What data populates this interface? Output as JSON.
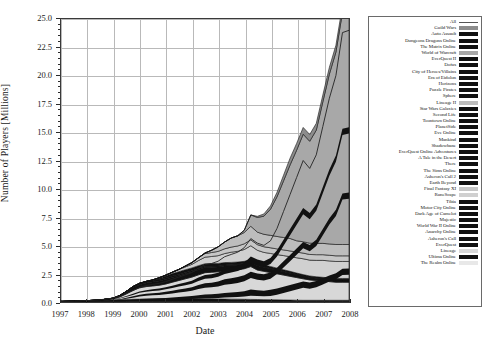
{
  "figure": {
    "xlabel": "Date",
    "ylabel": "Number of Players [Millions]"
  },
  "axes": {
    "yticks": [
      "0.0",
      "2.5",
      "5.0",
      "7.5",
      "10.0",
      "12.5",
      "15.0",
      "17.5",
      "20.0",
      "22.5",
      "25.0"
    ],
    "xticks": [
      "1997",
      "1998",
      "1999",
      "2000",
      "2001",
      "2002",
      "2003",
      "2004",
      "2005",
      "2006",
      "2007",
      "2008"
    ]
  },
  "legend": {
    "items": [
      {
        "label": "All",
        "swatch": "line",
        "color": "#555555"
      },
      {
        "label": "Guild Wars",
        "swatch": "fill",
        "color": "#8c8c8c"
      },
      {
        "label": "Auto Assault",
        "swatch": "fill",
        "color": "#111111"
      },
      {
        "label": "Dungeons Dragons Online",
        "swatch": "fill",
        "color": "#111111"
      },
      {
        "label": "The Matrix Online",
        "swatch": "fill",
        "color": "#111111"
      },
      {
        "label": "World of Warcraft",
        "swatch": "fill",
        "color": "#a8a8a8"
      },
      {
        "label": "EverQuest II",
        "swatch": "fill",
        "color": "#111111"
      },
      {
        "label": "Dofus",
        "swatch": "fill",
        "color": "#111111"
      },
      {
        "label": "City of Heroes/Villains",
        "swatch": "fill",
        "color": "#111111"
      },
      {
        "label": "Era of Eidolon",
        "swatch": "fill",
        "color": "#111111"
      },
      {
        "label": "Horizons",
        "swatch": "fill",
        "color": "#111111"
      },
      {
        "label": "Puzzle Pirates",
        "swatch": "fill",
        "color": "#111111"
      },
      {
        "label": "Sphere",
        "swatch": "fill",
        "color": "#111111"
      },
      {
        "label": "Lineage II",
        "swatch": "fill",
        "color": "#bdbdbd"
      },
      {
        "label": "Star Wars Galaxies",
        "swatch": "fill",
        "color": "#111111"
      },
      {
        "label": "Second Life",
        "swatch": "fill",
        "color": "#111111"
      },
      {
        "label": "Toontown Online",
        "swatch": "fill",
        "color": "#111111"
      },
      {
        "label": "PlanetSide",
        "swatch": "fill",
        "color": "#111111"
      },
      {
        "label": "Eve Online",
        "swatch": "fill",
        "color": "#111111"
      },
      {
        "label": "Mankind",
        "swatch": "fill",
        "color": "#111111"
      },
      {
        "label": "Shadowbane",
        "swatch": "fill",
        "color": "#111111"
      },
      {
        "label": "EverQuest Online Adventures",
        "swatch": "fill",
        "color": "#111111"
      },
      {
        "label": "A Tale in the Desert",
        "swatch": "fill",
        "color": "#111111"
      },
      {
        "label": "There",
        "swatch": "fill",
        "color": "#111111"
      },
      {
        "label": "The Sims Online",
        "swatch": "fill",
        "color": "#111111"
      },
      {
        "label": "Asheron's Call 2",
        "swatch": "fill",
        "color": "#111111"
      },
      {
        "label": "Earth Beyond",
        "swatch": "fill",
        "color": "#111111"
      },
      {
        "label": "Final Fantasy XI",
        "swatch": "fill",
        "color": "#c6c6c6"
      },
      {
        "label": "RuneScape",
        "swatch": "fill",
        "color": "#d0d0d0"
      },
      {
        "label": "Tibia",
        "swatch": "fill",
        "color": "#111111"
      },
      {
        "label": "Motor City Online",
        "swatch": "fill",
        "color": "#111111"
      },
      {
        "label": "Dark Age of Camelot",
        "swatch": "fill",
        "color": "#111111"
      },
      {
        "label": "Majestic",
        "swatch": "fill",
        "color": "#111111"
      },
      {
        "label": "World War II Online",
        "swatch": "fill",
        "color": "#111111"
      },
      {
        "label": "Anarchy Online",
        "swatch": "fill",
        "color": "#111111"
      },
      {
        "label": "Asheron's Call",
        "swatch": "fill",
        "color": "#111111"
      },
      {
        "label": "EverQuest",
        "swatch": "fill",
        "color": "#111111"
      },
      {
        "label": "Lineage",
        "swatch": "fill",
        "color": "#d8d8d8"
      },
      {
        "label": "Ultima Online",
        "swatch": "fill",
        "color": "#111111"
      },
      {
        "label": "The Realm Online",
        "swatch": "fill",
        "color": "#e8e8e8"
      }
    ]
  },
  "chart_data": {
    "type": "area",
    "title": "",
    "xlabel": "Date",
    "ylabel": "Number of Players [Millions]",
    "xlim": [
      1997,
      2008
    ],
    "ylim": [
      0,
      25
    ],
    "ytick_step": 2.5,
    "grid": true,
    "legend_position": "right-outside",
    "stacked": true,
    "x": [
      1997,
      1997.5,
      1998,
      1998.5,
      1999,
      1999.25,
      1999.5,
      1999.75,
      2000,
      2000.25,
      2000.5,
      2000.75,
      2001,
      2001.25,
      2001.5,
      2001.75,
      2002,
      2002.25,
      2002.5,
      2002.75,
      2003,
      2003.25,
      2003.5,
      2003.75,
      2004,
      2004.25,
      2004.5,
      2004.75,
      2005,
      2005.25,
      2005.5,
      2005.75,
      2006,
      2006.25,
      2006.5,
      2006.75,
      2007,
      2007.25,
      2007.5,
      2007.75,
      2008
    ],
    "total": [
      0.05,
      0.08,
      0.12,
      0.2,
      0.35,
      0.5,
      0.75,
      1.0,
      1.3,
      1.45,
      1.55,
      1.65,
      1.8,
      2.0,
      2.2,
      2.4,
      2.6,
      3.0,
      3.3,
      3.4,
      3.6,
      4.0,
      4.2,
      4.4,
      4.8,
      5.6,
      5.2,
      5.0,
      5.4,
      6.5,
      8.0,
      9.5,
      11.0,
      12.5,
      11.8,
      13.0,
      15.5,
      18.0,
      20.0,
      23.8,
      24.0
    ],
    "series": [
      {
        "name": "The Realm Online",
        "color": "#e8e8e8",
        "values": [
          0.03,
          0.04,
          0.05,
          0.05,
          0.05,
          0.05,
          0.05,
          0.05,
          0.05,
          0.05,
          0.05,
          0.05,
          0.05,
          0.05,
          0.05,
          0.05,
          0.05,
          0.05,
          0.05,
          0.05,
          0.05,
          0.05,
          0.05,
          0.05,
          0.05,
          0.05,
          0.05,
          0.05,
          0.05,
          0.05,
          0.05,
          0.05,
          0.05,
          0.05,
          0.05,
          0.05,
          0.05,
          0.05,
          0.05,
          0.05,
          0.05
        ]
      },
      {
        "name": "Ultima Online",
        "color": "#111111",
        "values": [
          0.02,
          0.04,
          0.07,
          0.1,
          0.13,
          0.15,
          0.17,
          0.19,
          0.2,
          0.21,
          0.22,
          0.23,
          0.24,
          0.25,
          0.25,
          0.25,
          0.25,
          0.25,
          0.24,
          0.23,
          0.22,
          0.21,
          0.2,
          0.2,
          0.19,
          0.18,
          0.17,
          0.16,
          0.15,
          0.14,
          0.13,
          0.12,
          0.11,
          0.1,
          0.1,
          0.1,
          0.1,
          0.1,
          0.1,
          0.1,
          0.1
        ]
      },
      {
        "name": "Lineage",
        "color": "#d8d8d8",
        "values": [
          0,
          0,
          0,
          0.02,
          0.1,
          0.25,
          0.5,
          0.8,
          1.0,
          1.1,
          1.15,
          1.2,
          1.3,
          1.45,
          1.6,
          1.75,
          1.9,
          2.1,
          2.3,
          2.35,
          2.4,
          2.5,
          2.55,
          2.6,
          2.7,
          2.9,
          2.6,
          2.5,
          2.4,
          2.3,
          2.2,
          2.1,
          2.0,
          1.9,
          1.8,
          1.75,
          1.7,
          1.65,
          1.6,
          1.6,
          1.6
        ]
      },
      {
        "name": "EverQuest",
        "color": "#111111",
        "values": [
          0,
          0,
          0,
          0.01,
          0.05,
          0.1,
          0.17,
          0.23,
          0.28,
          0.32,
          0.35,
          0.38,
          0.4,
          0.42,
          0.43,
          0.44,
          0.45,
          0.45,
          0.45,
          0.44,
          0.43,
          0.42,
          0.42,
          0.41,
          0.4,
          0.4,
          0.38,
          0.36,
          0.34,
          0.32,
          0.3,
          0.28,
          0.26,
          0.24,
          0.22,
          0.2,
          0.2,
          0.2,
          0.2,
          0.2,
          0.2
        ]
      },
      {
        "name": "Asheron's Call",
        "color": "#111111",
        "values": [
          0,
          0,
          0,
          0,
          0.01,
          0.03,
          0.06,
          0.09,
          0.11,
          0.12,
          0.12,
          0.12,
          0.12,
          0.12,
          0.11,
          0.11,
          0.1,
          0.1,
          0.09,
          0.09,
          0.08,
          0.08,
          0.07,
          0.07,
          0.06,
          0.06,
          0.05,
          0.05,
          0.05,
          0.04,
          0.04,
          0.04,
          0.03,
          0.03,
          0.03,
          0.03,
          0.03,
          0.03,
          0.03,
          0.03,
          0.03
        ]
      },
      {
        "name": "Dark Age of Camelot",
        "color": "#111111",
        "values": [
          0,
          0,
          0,
          0,
          0,
          0,
          0,
          0,
          0,
          0,
          0.02,
          0.1,
          0.18,
          0.22,
          0.24,
          0.25,
          0.26,
          0.26,
          0.25,
          0.24,
          0.23,
          0.22,
          0.21,
          0.2,
          0.19,
          0.18,
          0.17,
          0.16,
          0.15,
          0.14,
          0.13,
          0.12,
          0.11,
          0.1,
          0.1,
          0.1,
          0.1,
          0.1,
          0.1,
          0.1,
          0.1
        ]
      },
      {
        "name": "RuneScape",
        "color": "#d0d0d0",
        "values": [
          0,
          0,
          0,
          0,
          0,
          0,
          0,
          0,
          0.01,
          0.02,
          0.04,
          0.06,
          0.08,
          0.12,
          0.18,
          0.25,
          0.32,
          0.45,
          0.58,
          0.62,
          0.68,
          0.8,
          0.9,
          0.95,
          1.05,
          1.2,
          1.15,
          1.1,
          1.15,
          1.2,
          1.25,
          1.3,
          1.35,
          1.4,
          1.4,
          1.45,
          1.5,
          1.5,
          1.5,
          1.5,
          1.5
        ]
      },
      {
        "name": "Final Fantasy XI",
        "color": "#c6c6c6",
        "values": [
          0,
          0,
          0,
          0,
          0,
          0,
          0,
          0,
          0,
          0,
          0,
          0,
          0,
          0,
          0.02,
          0.08,
          0.15,
          0.25,
          0.32,
          0.35,
          0.38,
          0.42,
          0.45,
          0.47,
          0.5,
          0.52,
          0.5,
          0.5,
          0.5,
          0.5,
          0.5,
          0.5,
          0.5,
          0.5,
          0.5,
          0.5,
          0.5,
          0.5,
          0.5,
          0.5,
          0.5
        ]
      },
      {
        "name": "Lineage II",
        "color": "#bdbdbd",
        "values": [
          0,
          0,
          0,
          0,
          0,
          0,
          0,
          0,
          0,
          0,
          0,
          0,
          0,
          0,
          0,
          0,
          0,
          0,
          0.05,
          0.2,
          0.4,
          0.6,
          0.8,
          0.9,
          1.0,
          1.2,
          1.1,
          1.1,
          1.1,
          1.1,
          1.1,
          1.1,
          1.0,
          1.0,
          1.0,
          1.0,
          1.0,
          1.0,
          1.0,
          1.0,
          1.0
        ]
      },
      {
        "name": "World of Warcraft",
        "color": "#a8a8a8",
        "values": [
          0,
          0,
          0,
          0,
          0,
          0,
          0,
          0,
          0,
          0,
          0,
          0,
          0,
          0,
          0,
          0,
          0,
          0,
          0,
          0,
          0,
          0,
          0,
          0,
          0.2,
          1.0,
          1.3,
          1.6,
          2.3,
          3.5,
          5.0,
          6.5,
          8.0,
          9.5,
          9.0,
          10.0,
          12.5,
          15.0,
          17.0,
          20.5,
          20.5
        ]
      },
      {
        "name": "Guild Wars",
        "color": "#8c8c8c",
        "values": [
          0,
          0,
          0,
          0,
          0,
          0,
          0,
          0,
          0,
          0,
          0,
          0,
          0,
          0,
          0,
          0,
          0,
          0,
          0,
          0,
          0,
          0,
          0,
          0,
          0,
          0,
          0.1,
          0.2,
          0.3,
          0.4,
          0.5,
          0.6,
          0.6,
          0.6,
          0.6,
          0.6,
          0.6,
          0.6,
          0.6,
          0.6,
          0.6
        ]
      }
    ]
  }
}
